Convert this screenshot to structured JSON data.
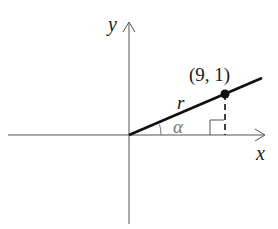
{
  "diagram": {
    "type": "coordinate-plane-ray",
    "axes": {
      "x_label": "x",
      "y_label": "y"
    },
    "ray": {
      "label": "r",
      "point_label": "(9, 1)",
      "point": [
        9,
        1
      ]
    },
    "angle_label": "α",
    "right_angle_marker": true,
    "colors": {
      "axis": "#555555",
      "ray": "#111111",
      "angle": "#777777",
      "dashed": "#111111"
    }
  }
}
